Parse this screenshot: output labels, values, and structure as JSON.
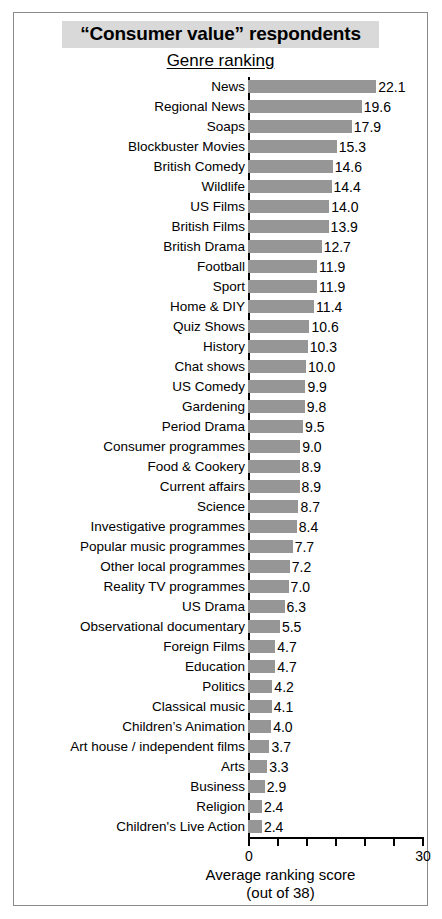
{
  "chart_title": "“Consumer value” respondents",
  "chart_subtitle": "Genre ranking",
  "axis": {
    "x_title": "Average ranking score",
    "x_subtitle": "(out of 38)",
    "x_tick_labels_visible": [
      "0",
      "30"
    ],
    "x_min_label": "0",
    "x_max_label": "30"
  },
  "colors": {
    "bar_fill": "#969696",
    "title_highlight": "#d9d9d9",
    "axis": "#000000",
    "frame_border": "#8a8a8a"
  },
  "chart_data": {
    "type": "bar",
    "orientation": "horizontal",
    "title": "“Consumer value” respondents",
    "subtitle": "Genre ranking",
    "xlabel": "Average ranking score (out of 38)",
    "ylabel": "",
    "xlim": [
      0,
      30
    ],
    "xticks": [
      0,
      5,
      10,
      15,
      20,
      25,
      30
    ],
    "xtick_labels": [
      "0",
      "",
      "",
      "",
      "",
      "",
      "30"
    ],
    "grid": false,
    "legend": false,
    "categories": [
      "News",
      "Regional News",
      "Soaps",
      "Blockbuster Movies",
      "British Comedy",
      "Wildlife",
      "US Films",
      "British Films",
      "British Drama",
      "Football",
      "Sport",
      "Home & DIY",
      "Quiz Shows",
      "History",
      "Chat shows",
      "US Comedy",
      "Gardening",
      "Period Drama",
      "Consumer programmes",
      "Food & Cookery",
      "Current affairs",
      "Science",
      "Investigative programmes",
      "Popular music programmes",
      "Other local programmes",
      "Reality TV programmes",
      "US Drama",
      "Observational documentary",
      "Foreign Films",
      "Education",
      "Politics",
      "Classical music",
      "Children’s Animation",
      "Art house / independent films",
      "Arts",
      "Business",
      "Religion",
      "Children's Live Action"
    ],
    "values": [
      22.1,
      19.6,
      17.9,
      15.3,
      14.6,
      14.4,
      14.0,
      13.9,
      12.7,
      11.9,
      11.9,
      11.4,
      10.6,
      10.3,
      10.0,
      9.9,
      9.8,
      9.5,
      9.0,
      8.9,
      8.9,
      8.7,
      8.4,
      7.7,
      7.2,
      7.0,
      6.3,
      5.5,
      4.7,
      4.7,
      4.2,
      4.1,
      4.0,
      3.7,
      3.3,
      2.9,
      2.4,
      2.4
    ],
    "value_labels": [
      "22.1",
      "19.6",
      "17.9",
      "15.3",
      "14.6",
      "14.4",
      "14.0",
      "13.9",
      "12.7",
      "11.9",
      "11.9",
      "11.4",
      "10.6",
      "10.3",
      "10.0",
      "9.9",
      "9.8",
      "9.5",
      "9.0",
      "8.9",
      "8.9",
      "8.7",
      "8.4",
      "7.7",
      "7.2",
      "7.0",
      "6.3",
      "5.5",
      "4.7",
      "4.7",
      "4.2",
      "4.1",
      "4.0",
      "3.7",
      "3.3",
      "2.9",
      "2.4",
      "2.4"
    ]
  }
}
